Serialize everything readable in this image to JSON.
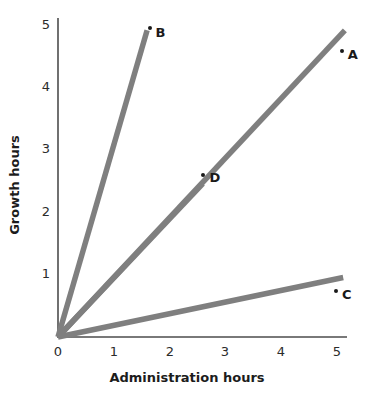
{
  "chart_data": {
    "type": "line",
    "title": "",
    "xlabel": "Administration hours",
    "ylabel": "Growth hours",
    "xlim": [
      0,
      5.4
    ],
    "ylim": [
      0,
      5.4
    ],
    "xticks": [
      "0",
      "1",
      "2",
      "3",
      "4",
      "5"
    ],
    "yticks": [
      "1",
      "2",
      "3",
      "4",
      "5"
    ],
    "grid": false,
    "legend": "none",
    "line_color": "#7f7f7f",
    "axis_color": "#4d4d4d",
    "text_color": "#1a1a1a",
    "series": [
      {
        "name": "B",
        "label": "B",
        "slope": 3.06,
        "x_start": 0,
        "y_start": 0,
        "x_end": 1.6,
        "y_end": 4.9,
        "point": {
          "x": 1.65,
          "y": 4.93
        },
        "label_x": 1.75,
        "label_y": 4.88
      },
      {
        "name": "A",
        "label": "A",
        "slope": 0.95,
        "x_start": 0,
        "y_start": 0,
        "x_end": 5.15,
        "y_end": 4.9,
        "point": {
          "x": 5.09,
          "y": 4.57
        },
        "label_x": 5.2,
        "label_y": 4.52
      },
      {
        "name": "C",
        "label": "C",
        "slope": 0.18,
        "x_start": 0,
        "y_start": 0,
        "x_end": 5.12,
        "y_end": 0.95,
        "point": {
          "x": 4.99,
          "y": 0.74
        },
        "label_x": 5.1,
        "label_y": 0.69
      },
      {
        "name": "D",
        "label": "D",
        "slope": 0.95,
        "x_start": 0,
        "y_start": 0,
        "x_end": 2.6,
        "y_end": 2.45,
        "point": {
          "x": 2.6,
          "y": 2.58
        },
        "label_x": 2.72,
        "label_y": 2.55,
        "on_line": "A"
      }
    ]
  }
}
